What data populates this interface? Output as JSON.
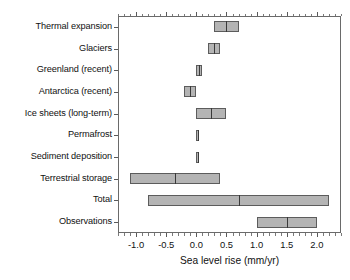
{
  "chart_data": {
    "type": "bar",
    "title": "",
    "xlabel": "Sea level rise (mm/yr)",
    "ylabel": "",
    "xlim": [
      -1.3,
      2.4
    ],
    "grid": false,
    "legend": null,
    "orientation": "horizontal",
    "style": "range bars with central best-estimate line",
    "xticks": [
      -1.0,
      -0.5,
      0.0,
      0.5,
      1.0,
      1.5,
      2.0
    ],
    "xticklabels": [
      "-1.0",
      "-0.5",
      "0.0",
      "0.5",
      "1.0",
      "1.5",
      "2.0"
    ],
    "xtick_minor_step": 0.1,
    "categories": [
      "Thermal expansion",
      "Glaciers",
      "Greenland (recent)",
      "Antarctica (recent)",
      "Ice sheets (long-term)",
      "Permafrost",
      "Sediment deposition",
      "Terrestrial storage",
      "Total",
      "Observations"
    ],
    "bars": [
      {
        "label": "Thermal expansion",
        "low": 0.3,
        "high": 0.7,
        "center": 0.5
      },
      {
        "label": "Glaciers",
        "low": 0.2,
        "high": 0.4,
        "center": 0.3
      },
      {
        "label": "Greenland (recent)",
        "low": 0.0,
        "high": 0.1,
        "center": 0.05
      },
      {
        "label": "Antarctica (recent)",
        "low": -0.2,
        "high": 0.0,
        "center": -0.1
      },
      {
        "label": "Ice sheets (long-term)",
        "low": 0.0,
        "high": 0.5,
        "center": 0.25
      },
      {
        "label": "Permafrost",
        "low": 0.0,
        "high": 0.05,
        "center": 0.025
      },
      {
        "label": "Sediment deposition",
        "low": 0.0,
        "high": 0.05,
        "center": 0.025
      },
      {
        "label": "Terrestrial storage",
        "low": -1.1,
        "high": 0.4,
        "center": -0.35
      },
      {
        "label": "Total",
        "low": -0.8,
        "high": 2.2,
        "center": 0.7
      },
      {
        "label": "Observations",
        "low": 1.0,
        "high": 2.0,
        "center": 1.5
      }
    ],
    "colors": {
      "bar_fill": "#b4b4b4",
      "bar_edge": "#5c5c5c",
      "center_line": "#3a3a3a",
      "axis": "#5a5a5a",
      "text": "#111111",
      "background": "#ffffff"
    }
  }
}
